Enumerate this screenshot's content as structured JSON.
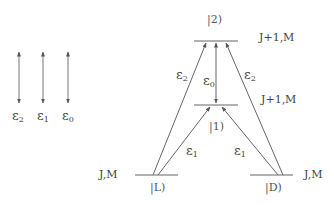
{
  "legend": {
    "arrows": [
      {
        "symbol": "ε",
        "sub": "2"
      },
      {
        "symbol": "ε",
        "sub": "1"
      },
      {
        "symbol": "ε",
        "sub": "0"
      }
    ]
  },
  "levels": {
    "top": {
      "ket": "|2)",
      "quantum": "J+1,M"
    },
    "middle": {
      "ket": "|1)",
      "quantum": "J+1,M"
    },
    "left": {
      "ket": "|L)",
      "quantum": "J,M"
    },
    "right": {
      "ket": "|D)",
      "quantum": "J,M"
    }
  },
  "transitions": {
    "left_to_top": {
      "symbol": "ε",
      "sub": "2"
    },
    "right_to_top": {
      "symbol": "ε",
      "sub": "2"
    },
    "top_middle": {
      "symbol": "ε",
      "sub": "0"
    },
    "left_to_middle": {
      "symbol": "ε",
      "sub": "1"
    },
    "right_to_middle": {
      "symbol": "ε",
      "sub": "1"
    }
  },
  "colors": {
    "line": "#555555",
    "text": "#444444"
  }
}
